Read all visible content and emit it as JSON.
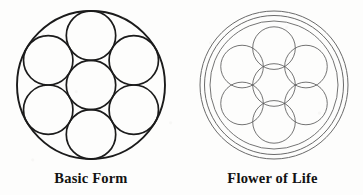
{
  "page": {
    "background_color": "#fdfdfc",
    "width": 363,
    "height": 195
  },
  "figures": [
    {
      "id": "basic-form",
      "caption": "Basic Form",
      "stroke_color": "#1b1b1b",
      "center": {
        "x": 91,
        "y": 85
      },
      "outer_radius": 74,
      "outer_stroke_width": 1.9,
      "inner_stroke_width": 1.7,
      "inner_circle_radius": 24.7,
      "inner_circle_count": 7,
      "inner_ring_count": 6,
      "description": "One large circle enclosing seven tangent circles: one centered, six around it."
    },
    {
      "id": "flower-of-life",
      "caption": "Flower of Life",
      "stroke_color": "#5b5b5b",
      "outer_ring_color": "#6a6a6a",
      "center": {
        "x": 92,
        "y": 85
      },
      "outer_radius": 74,
      "second_ring_radius": 69.5,
      "pattern_radius": 64,
      "unit_radius": 21.3,
      "outer_stroke_width": 1.0,
      "pattern_stroke_width": 0.85,
      "lattice_rings": 3,
      "circle_count": 19,
      "description": "Double outer ring enclosing the classic nineteen overlapping circles of the Flower of Life lattice."
    }
  ]
}
